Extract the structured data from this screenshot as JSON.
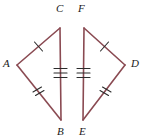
{
  "figure": {
    "canvas": {
      "width": 146,
      "height": 140
    },
    "stroke_color": "#8a4a52",
    "tick_color": "#2b2b2b",
    "label_color": "#1a1a1a",
    "background": "#ffffff",
    "stroke_width": 1.6,
    "tick_width": 1.1
  },
  "labels": {
    "a": "A",
    "b": "B",
    "c": "C",
    "d": "D",
    "e": "E",
    "f": "F"
  },
  "label_positions": {
    "a": {
      "x": 3,
      "y": 58
    },
    "b": {
      "x": 57,
      "y": 126
    },
    "c": {
      "x": 56,
      "y": 3
    },
    "d": {
      "x": 131,
      "y": 58
    },
    "e": {
      "x": 79,
      "y": 126
    },
    "f": {
      "x": 78,
      "y": 3
    }
  },
  "vertices": {
    "A": {
      "x": 17,
      "y": 65
    },
    "B": {
      "x": 61,
      "y": 120
    },
    "C": {
      "x": 60,
      "y": 28
    },
    "D": {
      "x": 125,
      "y": 65
    },
    "E": {
      "x": 83,
      "y": 120
    },
    "F": {
      "x": 84,
      "y": 28
    }
  },
  "segments": [
    {
      "name": "AC",
      "from": "A",
      "to": "C",
      "ticks": 1
    },
    {
      "name": "AB",
      "from": "A",
      "to": "B",
      "ticks": 2
    },
    {
      "name": "CB",
      "from": "C",
      "to": "B",
      "ticks": 3
    },
    {
      "name": "FD",
      "from": "F",
      "to": "D",
      "ticks": 1
    },
    {
      "name": "ED",
      "from": "E",
      "to": "D",
      "ticks": 2
    },
    {
      "name": "FE",
      "from": "F",
      "to": "E",
      "ticks": 3
    }
  ],
  "congruence": {
    "single_tick_pair": "AC and FD",
    "double_tick_pair": "AB and ED",
    "triple_tick_pair": "CB and FE"
  }
}
